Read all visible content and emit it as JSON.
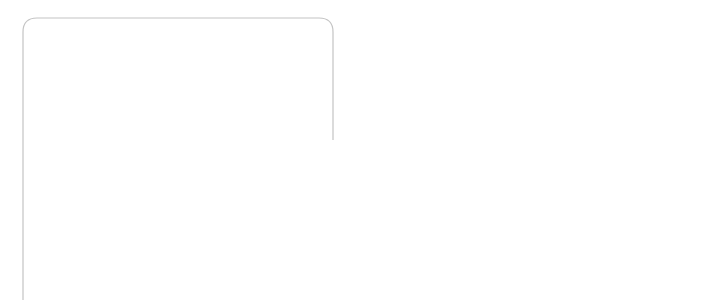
{
  "figure": {
    "number": "Fig. 14.5",
    "caption": "The anterior chamber of the eye, showing the pathway for secretion and drainage of the aqueous humour."
  },
  "labels": {
    "cornea": "Cornea",
    "dilator_muscle": [
      "Dilator",
      "muscle"
    ],
    "constrictor_muscle": [
      "Constrictor",
      "muscle"
    ],
    "iris": "Iris",
    "pathway": [
      "Pathway for",
      "aqueous humour"
    ],
    "canal_of_schlemm": [
      "Canal of",
      "Schlemm"
    ],
    "lens": "Lens",
    "ciliary_muscle": [
      "Ciliary",
      "muscle"
    ],
    "suspensory_ligaments": [
      "Suspensory",
      "ligaments"
    ],
    "ciliary_body": [
      "Ciliary",
      "body"
    ]
  },
  "colors": {
    "frame": "#c4c4c4",
    "iris_fill": "#8a8a8a",
    "sclera_fill": "#d9d9d9",
    "lens_fill": "#f2f2f2",
    "line": "#333333"
  }
}
